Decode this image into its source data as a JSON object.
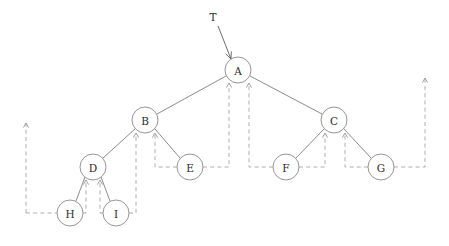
{
  "diagram": {
    "type": "threaded-binary-tree",
    "title": "",
    "canvas": {
      "width": 449,
      "height": 246,
      "background": "#ffffff"
    },
    "style": {
      "node_fill": "#ffffff",
      "node_stroke": "#8a8a8a",
      "label_color": "#2b2b2b",
      "tree_edge_color": "#6e6e6e",
      "thread_edge_color": "#9a9a9a",
      "root_pointer_color": "#5e5e5e",
      "node_radius": 13,
      "thread_dash": "4 3.2"
    },
    "root_pointer": {
      "label": "T",
      "label_x": 213,
      "label_y": 17,
      "from_x": 218,
      "from_y": 26,
      "to_x": 231,
      "to_y": 59
    },
    "nodes": [
      {
        "id": "A",
        "label": "A",
        "x": 238,
        "y": 70,
        "r": 13,
        "level": 0
      },
      {
        "id": "B",
        "label": "B",
        "x": 145,
        "y": 120,
        "r": 13,
        "level": 1
      },
      {
        "id": "C",
        "label": "C",
        "x": 334,
        "y": 120,
        "r": 13,
        "level": 1
      },
      {
        "id": "D",
        "label": "D",
        "x": 93,
        "y": 167,
        "r": 13,
        "level": 2
      },
      {
        "id": "E",
        "label": "E",
        "x": 190,
        "y": 167,
        "r": 13,
        "level": 2
      },
      {
        "id": "F",
        "label": "F",
        "x": 286,
        "y": 167,
        "r": 13,
        "level": 2
      },
      {
        "id": "G",
        "label": "G",
        "x": 381,
        "y": 167,
        "r": 13,
        "level": 2
      },
      {
        "id": "H",
        "label": "H",
        "x": 70,
        "y": 213,
        "r": 13,
        "level": 3
      },
      {
        "id": "I",
        "label": "I",
        "x": 116,
        "y": 213,
        "r": 13,
        "level": 3
      }
    ],
    "tree_edges": [
      {
        "from": "A",
        "to": "B",
        "x1": 226,
        "y1": 76,
        "x2": 157,
        "y2": 114
      },
      {
        "from": "A",
        "to": "C",
        "x1": 250,
        "y1": 76,
        "x2": 322,
        "y2": 114
      },
      {
        "from": "B",
        "to": "D",
        "x1": 135,
        "y1": 129,
        "x2": 103,
        "y2": 158
      },
      {
        "from": "B",
        "to": "E",
        "x1": 155,
        "y1": 129,
        "x2": 180,
        "y2": 158
      },
      {
        "from": "C",
        "to": "F",
        "x1": 324,
        "y1": 129,
        "x2": 296,
        "y2": 158
      },
      {
        "from": "C",
        "to": "G",
        "x1": 344,
        "y1": 129,
        "x2": 371,
        "y2": 158
      },
      {
        "from": "D",
        "to": "H",
        "x1": 85,
        "y1": 177,
        "x2": 76,
        "y2": 201
      },
      {
        "from": "D",
        "to": "I",
        "x1": 101,
        "y1": 177,
        "x2": 110,
        "y2": 201
      }
    ],
    "threads": [
      {
        "from": "H",
        "to": "D",
        "path": "M 26,213 L 57,213",
        "desc": "left-outer-to-H"
      },
      {
        "from": "H",
        "to": "D",
        "path": "M 83,213 L 86,213 L 86,182",
        "desc": "H-right-thread-up-to-D"
      },
      {
        "from": "I",
        "to": "D",
        "path": "M 103,213 L 100,213 L 100,182",
        "desc": "I-left-thread-up-to-D"
      },
      {
        "from": "I",
        "to": "B",
        "path": "M 129,213 L 136,213 L 136,135",
        "desc": "I-right-thread-up-to-B"
      },
      {
        "from": "E",
        "to": "B",
        "path": "M 177,167 L 155,167 L 155,135",
        "desc": "E-left-thread-up-to-B"
      },
      {
        "from": "E",
        "to": "A",
        "path": "M 203,167 L 229,167 L 229,85",
        "desc": "E-right-thread-up-to-A"
      },
      {
        "from": "F",
        "to": "A",
        "path": "M 273,167 L 249,167 L 249,85",
        "desc": "F-left-thread-up-to-A"
      },
      {
        "from": "F",
        "to": "C",
        "path": "M 299,167 L 325,167 L 325,135",
        "desc": "F-right-thread-up-to-C"
      },
      {
        "from": "G",
        "to": "C",
        "path": "M 368,167 L 345,167 L 345,135",
        "desc": "G-left-thread-up-to-C"
      },
      {
        "from": "G",
        "to": "outer",
        "path": "M 394,167 L 425,167 L 425,78",
        "desc": "G-right-thread-to-right-outer"
      },
      {
        "from": "outer",
        "to": "left",
        "path": "M 26,213 L 26,123",
        "desc": "left-outer-vertical"
      }
    ],
    "thread_arrowheads": [
      {
        "x": 86,
        "y": 180,
        "dir": "up",
        "target": "D"
      },
      {
        "x": 100,
        "y": 180,
        "dir": "up",
        "target": "D"
      },
      {
        "x": 136,
        "y": 133,
        "dir": "up",
        "target": "B"
      },
      {
        "x": 155,
        "y": 133,
        "dir": "up",
        "target": "B"
      },
      {
        "x": 229,
        "y": 83,
        "dir": "up",
        "target": "A"
      },
      {
        "x": 249,
        "y": 83,
        "dir": "up",
        "target": "A"
      },
      {
        "x": 325,
        "y": 133,
        "dir": "up",
        "target": "C"
      },
      {
        "x": 345,
        "y": 133,
        "dir": "up",
        "target": "C"
      },
      {
        "x": 26,
        "y": 123,
        "dir": "up",
        "target": "outer-left"
      },
      {
        "x": 425,
        "y": 78,
        "dir": "up",
        "target": "outer-right"
      }
    ]
  }
}
